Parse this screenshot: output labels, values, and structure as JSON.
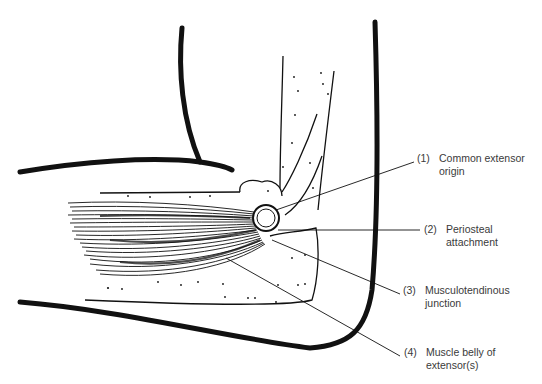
{
  "figure": {
    "colors": {
      "ink": "#111111",
      "label_text": "#3a3a3a",
      "background": "#ffffff"
    }
  },
  "labels": [
    {
      "number": "(1)",
      "line1": "Common extensor",
      "line2": "origin"
    },
    {
      "number": "(2)",
      "line1": "Periosteal",
      "line2": "attachment"
    },
    {
      "number": "(3)",
      "line1": "Musculotendinous",
      "line2": "junction"
    },
    {
      "number": "(4)",
      "line1": "Muscle belly of",
      "line2": "extensor(s)"
    }
  ]
}
